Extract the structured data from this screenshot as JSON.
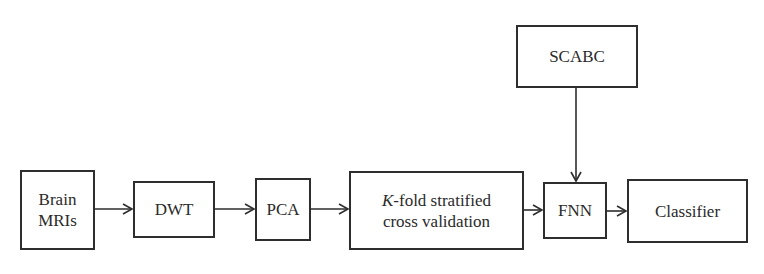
{
  "diagram": {
    "type": "flowchart",
    "nodes": [
      {
        "id": "brain_mris",
        "lines": [
          "Brain",
          "MRIs"
        ]
      },
      {
        "id": "dwt",
        "lines": [
          "DWT"
        ]
      },
      {
        "id": "pca",
        "lines": [
          "PCA"
        ]
      },
      {
        "id": "kfold",
        "prefix_italic": "K",
        "line1_rest": "-fold stratified",
        "line2": "cross validation"
      },
      {
        "id": "fnn",
        "lines": [
          "FNN"
        ]
      },
      {
        "id": "classifier",
        "lines": [
          "Classifier"
        ]
      },
      {
        "id": "scabc",
        "lines": [
          "SCABC"
        ]
      }
    ],
    "edges": [
      {
        "from": "brain_mris",
        "to": "dwt"
      },
      {
        "from": "dwt",
        "to": "pca"
      },
      {
        "from": "pca",
        "to": "kfold"
      },
      {
        "from": "kfold",
        "to": "fnn"
      },
      {
        "from": "fnn",
        "to": "classifier"
      },
      {
        "from": "scabc",
        "to": "fnn"
      }
    ]
  }
}
